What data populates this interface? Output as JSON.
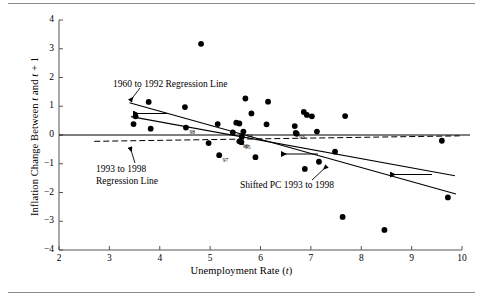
{
  "figure": {
    "type": "scatter-with-regression-lines",
    "has_top_rule": true,
    "has_bottom_rule": true
  },
  "chart_data": {
    "type": "scatter",
    "title": "",
    "xlabel": "Unemployment Rate (t)",
    "ylabel": "Inflation Change Between t and t + 1",
    "xlim": [
      2,
      10
    ],
    "ylim": [
      -4,
      4
    ],
    "xticks": [
      2,
      3,
      4,
      5,
      6,
      7,
      8,
      9,
      10
    ],
    "yticks": [
      4,
      3,
      2,
      1,
      0,
      -1,
      -2,
      -3,
      -4
    ],
    "grid": false,
    "legend_position": "none",
    "zero_line": 0,
    "points": [
      {
        "x": 3.48,
        "y": 0.38,
        "label": ""
      },
      {
        "x": 3.52,
        "y": 0.65,
        "label": ""
      },
      {
        "x": 3.78,
        "y": 1.15,
        "label": ""
      },
      {
        "x": 3.82,
        "y": 0.22,
        "label": ""
      },
      {
        "x": 4.5,
        "y": 0.97,
        "label": ""
      },
      {
        "x": 4.52,
        "y": 0.26,
        "label": "98"
      },
      {
        "x": 4.82,
        "y": 3.17,
        "label": ""
      },
      {
        "x": 4.97,
        "y": -0.28,
        "label": ""
      },
      {
        "x": 5.15,
        "y": 0.38,
        "label": ""
      },
      {
        "x": 5.18,
        "y": -0.7,
        "label": "97"
      },
      {
        "x": 5.45,
        "y": 0.09,
        "label": ""
      },
      {
        "x": 5.52,
        "y": 0.43,
        "label": ""
      },
      {
        "x": 5.58,
        "y": 0.4,
        "label": ""
      },
      {
        "x": 5.58,
        "y": -0.22,
        "label": "96"
      },
      {
        "x": 5.62,
        "y": -0.25,
        "label": "95"
      },
      {
        "x": 5.63,
        "y": -0.05,
        "label": ""
      },
      {
        "x": 5.66,
        "y": 0.12,
        "label": "94"
      },
      {
        "x": 5.7,
        "y": 1.27,
        "label": ""
      },
      {
        "x": 5.82,
        "y": 0.75,
        "label": ""
      },
      {
        "x": 5.9,
        "y": -0.77,
        "label": ""
      },
      {
        "x": 6.12,
        "y": 0.37,
        "label": ""
      },
      {
        "x": 6.15,
        "y": 1.16,
        "label": ""
      },
      {
        "x": 6.68,
        "y": 0.31,
        "label": ""
      },
      {
        "x": 6.7,
        "y": 0.07,
        "label": "93"
      },
      {
        "x": 6.72,
        "y": 0.04,
        "label": ""
      },
      {
        "x": 6.86,
        "y": 0.8,
        "label": ""
      },
      {
        "x": 6.88,
        "y": -1.18,
        "label": ""
      },
      {
        "x": 6.92,
        "y": 0.7,
        "label": ""
      },
      {
        "x": 7.02,
        "y": 0.65,
        "label": ""
      },
      {
        "x": 7.12,
        "y": 0.12,
        "label": ""
      },
      {
        "x": 7.16,
        "y": -0.93,
        "label": ""
      },
      {
        "x": 7.48,
        "y": -0.58,
        "label": ""
      },
      {
        "x": 7.63,
        "y": -2.85,
        "label": ""
      },
      {
        "x": 7.68,
        "y": 0.66,
        "label": ""
      },
      {
        "x": 8.46,
        "y": -3.3,
        "label": ""
      },
      {
        "x": 9.6,
        "y": -0.2,
        "label": ""
      },
      {
        "x": 9.72,
        "y": -2.17,
        "label": ""
      }
    ],
    "lines": [
      {
        "name": "1960 to 1992 Regression Line",
        "style": "solid",
        "x1": 3.4,
        "y1": 1.12,
        "x2": 9.88,
        "y2": -2.05
      },
      {
        "name": "1993 to 1998 Regression Line",
        "style": "dashed",
        "x1": 2.7,
        "y1": -0.22,
        "x2": 9.95,
        "y2": -0.03
      },
      {
        "name": "Shifted PC 1993 to 1998",
        "style": "solid",
        "x1": 3.43,
        "y1": 0.64,
        "x2": 9.86,
        "y2": -1.42
      }
    ],
    "annotations": [
      {
        "id": "ann-1960-1992",
        "text": "1960 to 1992 Regression Line"
      },
      {
        "id": "ann-1993-1998",
        "text": "1993 to 1998\nRegression Line"
      },
      {
        "id": "ann-shifted-pc",
        "text": "Shifted PC 1993 to 1998"
      }
    ],
    "arrows": [
      {
        "id": "arrow-upper-left",
        "direction": "left"
      },
      {
        "id": "arrow-middle",
        "direction": "left"
      },
      {
        "id": "arrow-lower-right",
        "direction": "left"
      }
    ],
    "colors": {
      "point": "#000000",
      "line": "#000000",
      "axis": "#555555",
      "rule": "#8a8a8a"
    }
  },
  "axis": {
    "xlabel_prefix": "Unemployment Rate (",
    "xlabel_var": "t",
    "xlabel_suffix": ")",
    "ylabel_prefix": "Inflation Change Between ",
    "ylabel_var1": "t",
    "ylabel_mid": " and ",
    "ylabel_var2": "t",
    "ylabel_suffix": " + 1"
  },
  "ticks": {
    "x": [
      "2",
      "3",
      "4",
      "5",
      "6",
      "7",
      "8",
      "9",
      "10"
    ],
    "y": [
      "4",
      "3",
      "2",
      "1",
      "0",
      "−1",
      "−2",
      "−3",
      "−4"
    ]
  }
}
